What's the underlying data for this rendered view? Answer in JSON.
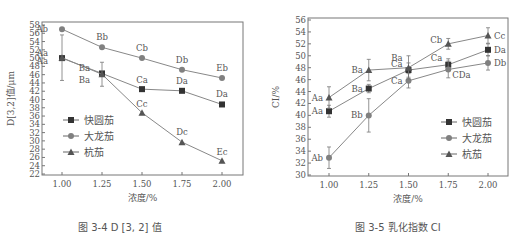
{
  "chart_data": [
    {
      "type": "line",
      "title": "图3-4 D[3, 2] 值",
      "xlabel": "浓度/%",
      "ylabel": "D[3,2]值/μm",
      "x": [
        1.0,
        1.25,
        1.5,
        1.75,
        2.0
      ],
      "x_tick_labels": [
        "1.00",
        "1.25",
        "1.50",
        "1.75",
        "2.00"
      ],
      "ylim": [
        22,
        58
      ],
      "y_ticks": [
        22,
        24,
        26,
        28,
        30,
        32,
        34,
        36,
        38,
        40,
        42,
        44,
        46,
        48,
        50,
        52,
        54,
        56,
        58
      ],
      "grid": false,
      "legend_position": "lower-left inside",
      "series": [
        {
          "name": "快圆茄",
          "marker": "square",
          "values": [
            50.0,
            46.3,
            42.5,
            42.1,
            38.8
          ],
          "labels": [
            "Aa",
            "Ba",
            "Ca",
            "Da",
            "Da"
          ],
          "error": [
            0.5,
            0.5,
            0.4,
            0.3,
            0.4
          ]
        },
        {
          "name": "大龙茄",
          "marker": "circle",
          "values": [
            57.0,
            52.6,
            50.0,
            47.2,
            45.2
          ],
          "labels": [
            "Ab",
            "Bb",
            "Cb",
            "Db",
            "Eb"
          ],
          "error": [
            0.4,
            0.4,
            0.3,
            0.3,
            0.3
          ]
        },
        {
          "name": "杭茄",
          "marker": "triangle",
          "values": [
            50.1,
            46.1,
            36.8,
            29.7,
            25.2
          ],
          "labels": [
            "Aa",
            "Ba",
            "Cc",
            "Dc",
            "Ec"
          ],
          "error": [
            5.5,
            2.9,
            0.6,
            0.4,
            0.3
          ]
        }
      ]
    },
    {
      "type": "line",
      "title": "图3-5 乳化指数 CI",
      "xlabel": "浓度/%",
      "ylabel": "CI/%",
      "x": [
        1.0,
        1.25,
        1.5,
        1.75,
        2.0
      ],
      "x_tick_labels": [
        "1.00",
        "1.25",
        "1.50",
        "1.75",
        "2.00"
      ],
      "ylim": [
        30,
        56
      ],
      "y_ticks": [
        30,
        32,
        34,
        36,
        38,
        40,
        42,
        44,
        46,
        48,
        50,
        52,
        54,
        56
      ],
      "grid": false,
      "legend_position": "lower-right inside",
      "series": [
        {
          "name": "快圆茄",
          "marker": "square",
          "values": [
            40.7,
            44.5,
            47.6,
            48.5,
            51.0
          ],
          "labels": [
            "Aa",
            "Ba",
            "Ca",
            "Ca",
            "Da"
          ],
          "error": [
            1.0,
            0.7,
            1.2,
            1.0,
            1.0
          ]
        },
        {
          "name": "大龙茄",
          "marker": "circle",
          "values": [
            32.9,
            40.0,
            45.8,
            47.7,
            48.8
          ],
          "labels": [
            "Ab",
            "Bb",
            "Ca",
            "CDa",
            "Db"
          ],
          "error": [
            1.8,
            2.8,
            1.2,
            1.4,
            1.2
          ]
        },
        {
          "name": "杭茄",
          "marker": "triangle",
          "values": [
            43.0,
            47.6,
            48.0,
            52.0,
            53.4
          ],
          "labels": [
            "Aa",
            "Ba",
            "Ba",
            "Cb",
            "Cc"
          ],
          "error": [
            1.8,
            1.8,
            2.0,
            0.9,
            1.3
          ]
        }
      ]
    }
  ],
  "captions": {
    "left": "图 3-4  D [3, 2] 值",
    "right": "图 3-5  乳化指数 CI"
  }
}
